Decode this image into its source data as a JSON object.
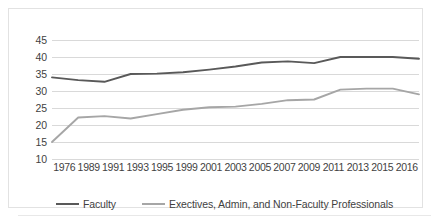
{
  "chart_data": {
    "type": "line",
    "title": "",
    "subtitle": "",
    "xlabel": "",
    "ylabel": "",
    "categories": [
      "1976",
      "1989",
      "1991",
      "1993",
      "1995",
      "1999",
      "2001",
      "2003",
      "2005",
      "2007",
      "2009",
      "2011",
      "2013",
      "2015",
      "2016"
    ],
    "ylim": [
      10,
      45
    ],
    "yticks": [
      45,
      40,
      35,
      30,
      25,
      20,
      15,
      10
    ],
    "grid": true,
    "legend_position": "bottom",
    "series": [
      {
        "name": "Faculty",
        "color": "#595959",
        "values": [
          34.0,
          33.2,
          32.7,
          35.0,
          35.1,
          35.5,
          36.3,
          37.2,
          38.4,
          38.7,
          38.2,
          40.0,
          40.0,
          40.0,
          39.5
        ]
      },
      {
        "name": "Exectives, Admin, and Non-Faculty Professionals",
        "color": "#a6a6a6",
        "values": [
          15.0,
          22.2,
          22.6,
          21.9,
          23.2,
          24.5,
          25.2,
          25.4,
          26.2,
          27.3,
          27.5,
          30.4,
          30.7,
          30.7,
          29.0
        ]
      }
    ]
  },
  "legend": {
    "items": [
      {
        "label": "Faculty",
        "color": "#595959"
      },
      {
        "label": "Exectives, Admin, and Non-Faculty Professionals",
        "color": "#a6a6a6"
      }
    ]
  },
  "axes": {
    "y_labels": [
      "45",
      "40",
      "35",
      "30",
      "25",
      "20",
      "15",
      "10"
    ],
    "x_labels": [
      "1976",
      "1989",
      "1991",
      "1993",
      "1995",
      "1999",
      "2001",
      "2003",
      "2005",
      "2007",
      "2009",
      "2011",
      "2013",
      "2015",
      "2016"
    ]
  }
}
